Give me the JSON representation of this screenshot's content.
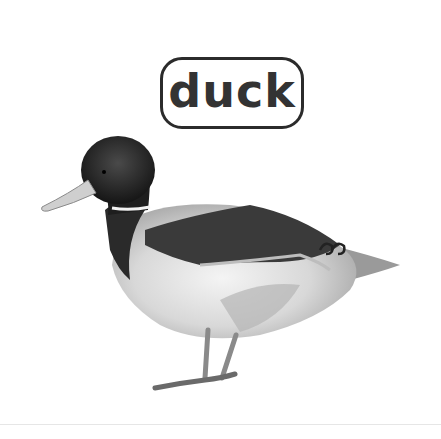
{
  "card": {
    "word": "duck",
    "image_subject": "mallard duck (grayscale photo)",
    "colors": {
      "background": "#ffffff",
      "label_border": "#2b2b2b",
      "label_text": "#333333"
    }
  }
}
